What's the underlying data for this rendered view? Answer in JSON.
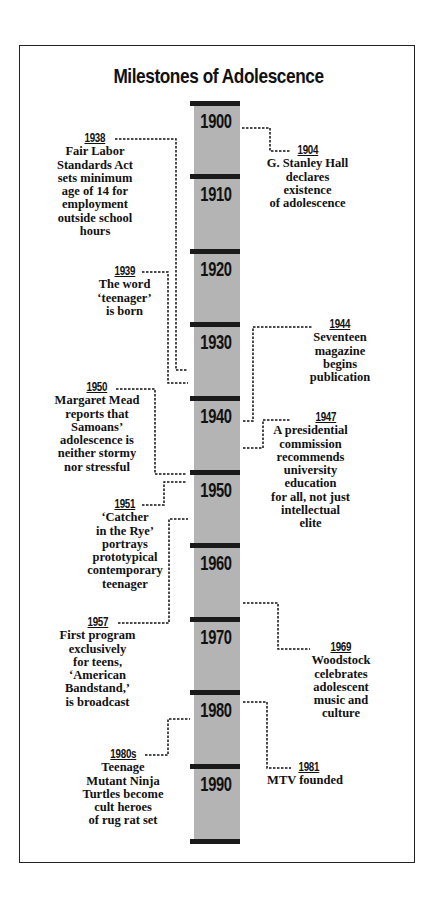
{
  "title": "Milestones of Adolescence",
  "decades": [
    "1900",
    "1910",
    "1920",
    "1930",
    "1940",
    "1950",
    "1960",
    "1970",
    "1980",
    "1990"
  ],
  "events": [
    {
      "year": "1938",
      "text": "Fair Labor Standards Act sets minimum age of 14 for employment outside school hours",
      "lines": [
        "Fair Labor",
        "Standards Act",
        "sets minimum",
        "age of 14 for",
        "employment",
        "outside school",
        "hours"
      ],
      "side": "left"
    },
    {
      "year": "1939",
      "text": "The word 'teenager' is born",
      "lines": [
        "The word",
        "‘teenager’",
        "is born"
      ],
      "side": "left"
    },
    {
      "year": "1950",
      "text": "Margaret Mead reports that Samoans' adolescence is neither stormy nor stressful",
      "lines": [
        "Margaret Mead",
        "reports that",
        "Samoans’",
        "adolescence is",
        "neither stormy",
        "nor stressful"
      ],
      "side": "left"
    },
    {
      "year": "1951",
      "text": "'Catcher in the Rye' portrays prototypical contemporary teenager",
      "lines": [
        "‘Catcher",
        "in the Rye’",
        "portrays",
        "prototypical",
        "contemporary",
        "teenager"
      ],
      "side": "left"
    },
    {
      "year": "1957",
      "text": "First program exclusively for teens, 'American Bandstand,' is broadcast",
      "lines": [
        "First program",
        "exclusively",
        "for teens,",
        "‘American",
        "Bandstand,’",
        "is broadcast"
      ],
      "side": "left"
    },
    {
      "year": "1980s",
      "text": "Teenage Mutant Ninja Turtles become cult heroes of rug rat set",
      "lines": [
        "Teenage",
        "Mutant Ninja",
        "Turtles become",
        "cult heroes",
        "of rug rat set"
      ],
      "side": "left"
    },
    {
      "year": "1904",
      "text": "G. Stanley Hall declares existence of adolescence",
      "lines": [
        "G. Stanley Hall",
        "declares",
        "existence",
        "of adolescence"
      ],
      "side": "right"
    },
    {
      "year": "1944",
      "text": "Seventeen magazine begins publication",
      "lines": [
        "Seventeen",
        "magazine",
        "begins",
        "publication"
      ],
      "side": "right"
    },
    {
      "year": "1947",
      "text": "A presidential commission recommends university education for all, not just intellectual elite",
      "lines": [
        "A presidential",
        "commission",
        "recommends",
        "university",
        "education",
        "for all, not just",
        "intellectual",
        "elite"
      ],
      "side": "right"
    },
    {
      "year": "1969",
      "text": "Woodstock celebrates adolescent music and culture",
      "lines": [
        "Woodstock",
        "celebrates",
        "adolescent",
        "music and",
        "culture"
      ],
      "side": "right"
    },
    {
      "year": "1981",
      "text": "MTV founded",
      "lines": [
        "MTV founded"
      ],
      "side": "right"
    }
  ]
}
